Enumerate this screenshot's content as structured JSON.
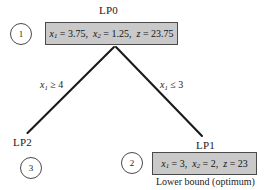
{
  "diagram": {
    "type": "branch-and-bound-tree",
    "title_visible": false,
    "background_color": "#ffffff",
    "box_fill_color": "#c9c9c9",
    "box_border_color": "#4a4a4a",
    "line_color": "#1a1a1a"
  },
  "nodes": [
    {
      "id": "lp0",
      "label": "LP0",
      "order_badge": "1",
      "solution_text": "x₁ = 3.75,  x₂ = 1.25,  z = 23.75",
      "x1": "3.75",
      "x2": "1.25",
      "z": "23.75",
      "has_box": true
    },
    {
      "id": "lp2",
      "label": "LP2",
      "order_badge": "3",
      "solution_text": "",
      "has_box": false
    },
    {
      "id": "lp1",
      "label": "LP1",
      "order_badge": "2",
      "solution_text": "x₁ = 3,  x₂ = 2,  z = 23",
      "x1": "3",
      "x2": "2",
      "z": "23",
      "has_box": true,
      "caption": "Lower bound (optimum)"
    }
  ],
  "edges": [
    {
      "from": "lp0",
      "to": "lp2",
      "label": "x₁ ≥ 4",
      "var": "x₁",
      "relation": "≥",
      "value": "4"
    },
    {
      "from": "lp0",
      "to": "lp1",
      "label": "x₁ ≤ 3",
      "var": "x₁",
      "relation": "≤",
      "value": "3"
    }
  ],
  "labels": {
    "lp0_title": "LP0",
    "lp1_title": "LP1",
    "lp2_title": "LP2",
    "badge_1": "1",
    "badge_2": "2",
    "badge_3": "3",
    "left_branch": "x₁ ≥ 4",
    "right_branch": "x₁ ≤ 3",
    "lower_bound_caption": "Lower bound (optimum)"
  }
}
